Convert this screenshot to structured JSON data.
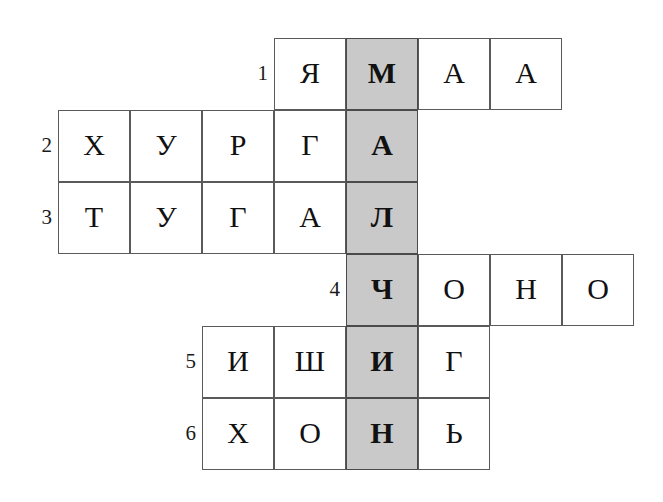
{
  "puzzle": {
    "kind": "crossword-grid",
    "language": "Mongolian Cyrillic",
    "cell_size_px": 72,
    "shaded_color": "#c9c9c9",
    "cell_border_color": "#5a5a5a",
    "text_color": "#111111",
    "background_color": "#ffffff",
    "highlight_column_index": 4,
    "keyword_down": "МАЛЧИН",
    "rows": [
      {
        "number": "1",
        "start_col": 3,
        "word": "ЯМАА",
        "letters": [
          "Я",
          "М",
          "А",
          "А"
        ],
        "shaded_letter_index": 1
      },
      {
        "number": "2",
        "start_col": 0,
        "word": "ХУРГА",
        "letters": [
          "Х",
          "У",
          "Р",
          "Г",
          "А"
        ],
        "shaded_letter_index": 4
      },
      {
        "number": "3",
        "start_col": 0,
        "word": "ТУГАЛ",
        "letters": [
          "Т",
          "У",
          "Г",
          "А",
          "Л"
        ],
        "shaded_letter_index": 4
      },
      {
        "number": "4",
        "start_col": 4,
        "word": "ЧОНО",
        "letters": [
          "Ч",
          "О",
          "Н",
          "О"
        ],
        "shaded_letter_index": 0
      },
      {
        "number": "5",
        "start_col": 2,
        "word": "ИШИГ",
        "letters": [
          "И",
          "Ш",
          "И",
          "Г"
        ],
        "shaded_letter_index": 2
      },
      {
        "number": "6",
        "start_col": 2,
        "word": "ХОНЬ",
        "letters": [
          "Х",
          "О",
          "Н",
          "Ь"
        ],
        "shaded_letter_index": 2
      }
    ]
  }
}
